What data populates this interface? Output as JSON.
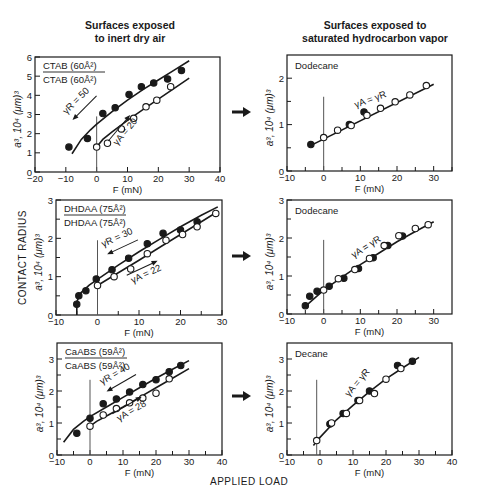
{
  "columns": {
    "left_title": [
      "Surfaces exposed",
      "to inert dry air"
    ],
    "right_title": [
      "Surfaces exposed to",
      "saturated hydrocarbon vapor"
    ]
  },
  "labels": {
    "y_side": "CONTACT RADIUS",
    "x_bottom": "APPLIED LOAD",
    "ylabel": "a³, 10⁴ (μm)³",
    "xlabel": "F (mN)"
  },
  "colors": {
    "ink": "#1a1a1a",
    "background": "#ffffff"
  },
  "chart_data": [
    {
      "id": "p1",
      "type": "scatter",
      "box": {
        "x0": 35,
        "x1": 220,
        "y0": 57,
        "y1": 172
      },
      "xlim": [
        -20,
        40
      ],
      "ylim": [
        0,
        6
      ],
      "xticks": [
        -20,
        -10,
        0,
        10,
        20,
        30,
        40
      ],
      "yticks": [
        0,
        1,
        2,
        3,
        4,
        5,
        6
      ],
      "yminor": [],
      "legend": {
        "top": "CTAB (60Å²)",
        "bottom": "CTAB (60Å²)"
      },
      "annotations": [
        {
          "text": "γR = 50",
          "x": -6,
          "y": 3.6,
          "angle": -45,
          "arrow": "down-left"
        },
        {
          "text": "γA = 20",
          "x": 10,
          "y": 2.0,
          "angle": -50,
          "arrow": "up-right"
        }
      ],
      "series": [
        {
          "name": "retraction",
          "marker": "filled",
          "x": [
            -9,
            -3,
            2,
            6,
            10.5,
            14.5,
            18.5,
            23,
            27.5
          ],
          "y": [
            1.3,
            1.75,
            3.05,
            3.35,
            4.05,
            4.45,
            4.65,
            4.85,
            5.3
          ],
          "curve_x": [
            -8,
            -5,
            -2,
            0,
            5,
            10,
            15,
            20,
            25,
            30
          ],
          "curve_y": [
            0.95,
            1.7,
            2.2,
            2.5,
            3.15,
            3.75,
            4.3,
            4.8,
            5.3,
            5.8
          ]
        },
        {
          "name": "advancing",
          "marker": "open",
          "x": [
            0,
            3.5,
            8,
            12,
            16,
            19.5,
            24
          ],
          "y": [
            1.3,
            1.5,
            2.25,
            2.8,
            3.4,
            3.75,
            4.45
          ],
          "curve_x": [
            0,
            2,
            5,
            10,
            15,
            20,
            25,
            30
          ],
          "curve_y": [
            1.3,
            1.7,
            2.1,
            2.7,
            3.25,
            3.8,
            4.35,
            4.9
          ]
        }
      ],
      "vline_x": 0,
      "vline_top": 2.9
    },
    {
      "id": "p2",
      "type": "scatter",
      "box": {
        "x0": 287,
        "x1": 452,
        "y0": 55,
        "y1": 171
      },
      "xlim": [
        -10,
        35
      ],
      "ylim": [
        0,
        2.5
      ],
      "xticks": [
        -10,
        0,
        10,
        20,
        30
      ],
      "xminor": [
        -5,
        5,
        15,
        25,
        35
      ],
      "yticks": [
        0,
        1,
        2
      ],
      "yminor": [
        0.5,
        1.5
      ],
      "legend_name": "Dodecane",
      "annotations": [
        {
          "text": "γA = γR",
          "x": 13,
          "y": 1.48,
          "angle": -20
        }
      ],
      "series": [
        {
          "name": "retraction",
          "marker": "filled",
          "x": [
            -3.5,
            7,
            11
          ],
          "y": [
            0.57,
            1.0,
            1.27
          ]
        },
        {
          "name": "advancing",
          "marker": "open",
          "x": [
            0,
            3.8,
            7.5,
            11.8,
            15.5,
            19.5,
            23.5,
            28
          ],
          "y": [
            0.72,
            0.88,
            0.98,
            1.2,
            1.35,
            1.49,
            1.64,
            1.84
          ],
          "curve_x": [
            -4,
            30
          ],
          "curve_y": [
            0.53,
            1.87
          ]
        }
      ],
      "vline_x": 0,
      "vline_top": 1.6
    },
    {
      "id": "p3",
      "type": "scatter",
      "box": {
        "x0": 56,
        "x1": 222,
        "y0": 200,
        "y1": 315
      },
      "xlim": [
        -10,
        30
      ],
      "ylim": [
        0,
        3
      ],
      "xticks": [
        -10,
        0,
        10,
        20,
        30
      ],
      "xminor": [
        -5,
        5,
        15,
        25
      ],
      "yticks": [
        0,
        1,
        2,
        3
      ],
      "yminor": [
        0.5,
        1.5,
        2.5
      ],
      "legend": {
        "top": "DHDAA (75Å²)",
        "bottom": "DHDAA (75Å²)"
      },
      "annotations": [
        {
          "text": "γR = 30",
          "x": 5,
          "y": 1.95,
          "angle": -25,
          "arrow": "down-left"
        },
        {
          "text": "γA = 22",
          "x": 12,
          "y": 1.0,
          "angle": -25,
          "arrow": "up-right"
        }
      ],
      "series": [
        {
          "name": "retraction",
          "marker": "filled",
          "x": [
            -5,
            -4.5,
            -2.8,
            -0.3,
            3.5,
            7.5,
            12,
            15.8,
            20,
            24
          ],
          "y": [
            0.28,
            0.5,
            0.63,
            0.94,
            1.18,
            1.48,
            1.86,
            2.13,
            2.22,
            2.43
          ],
          "curve_x": [
            -5,
            -5,
            -4,
            -2,
            0,
            5,
            10,
            15,
            20,
            25,
            29
          ],
          "curve_y": [
            0,
            0.35,
            0.58,
            0.78,
            0.93,
            1.3,
            1.65,
            1.98,
            2.3,
            2.6,
            2.82
          ]
        },
        {
          "name": "advancing",
          "marker": "open",
          "x": [
            0,
            4,
            8,
            12,
            16.5,
            20.5,
            24,
            28.5
          ],
          "y": [
            0.77,
            1.0,
            1.2,
            1.6,
            1.95,
            2.1,
            2.3,
            2.65
          ],
          "curve_x": [
            0,
            5,
            10,
            15,
            20,
            25,
            29
          ],
          "curve_y": [
            0.77,
            1.1,
            1.43,
            1.77,
            2.1,
            2.43,
            2.7
          ]
        }
      ],
      "vline_x": 0,
      "vline_top": 1.95
    },
    {
      "id": "p4",
      "type": "scatter",
      "box": {
        "x0": 287,
        "x1": 452,
        "y0": 200,
        "y1": 314
      },
      "xlim": [
        -10,
        35
      ],
      "ylim": [
        0,
        3
      ],
      "xticks": [
        -10,
        0,
        10,
        20,
        30
      ],
      "xminor": [
        -5,
        5,
        15,
        25
      ],
      "yticks": [
        0,
        1,
        2,
        3
      ],
      "yminor": [
        0.5,
        1.5,
        2.5
      ],
      "legend_name": "Dodecane",
      "annotations": [
        {
          "text": "γA = γR",
          "x": 12,
          "y": 1.7,
          "angle": -32
        }
      ],
      "series": [
        {
          "name": "retraction",
          "marker": "filled",
          "x": [
            -5,
            -3.8,
            -1.8,
            1.5,
            5.5,
            9.5,
            13.5,
            17.5,
            21.5
          ],
          "y": [
            0.22,
            0.47,
            0.6,
            0.73,
            0.94,
            1.2,
            1.48,
            1.8,
            2.05
          ],
          "curve_x": [
            -5,
            0,
            5,
            10,
            15,
            20,
            25,
            30
          ],
          "curve_y": [
            0.2,
            0.63,
            0.97,
            1.3,
            1.6,
            1.9,
            2.17,
            2.43
          ]
        },
        {
          "name": "advancing",
          "marker": "open",
          "x": [
            0,
            4,
            8.5,
            12.5,
            16.5,
            20.5,
            25,
            28.5
          ],
          "y": [
            0.63,
            0.93,
            1.17,
            1.46,
            1.8,
            2.06,
            2.25,
            2.35
          ]
        }
      ],
      "vline_x": 0,
      "vline_top": 1.95
    },
    {
      "id": "p5",
      "type": "scatter",
      "box": {
        "x0": 57,
        "x1": 222,
        "y0": 343,
        "y1": 455
      },
      "xlim": [
        -10,
        40
      ],
      "ylim": [
        0,
        3.5
      ],
      "xticks": [
        -10,
        0,
        10,
        20,
        30,
        40
      ],
      "xminor": [
        -5,
        5,
        15,
        25,
        35
      ],
      "yticks": [
        0,
        1,
        2,
        3
      ],
      "yminor": [
        0.5,
        1.5,
        2.5
      ],
      "legend": {
        "top": "CaABS (59Å²)",
        "bottom": "CaABS (59Å²)"
      },
      "annotations": [
        {
          "text": "γR = 40",
          "x": 8,
          "y": 2.45,
          "angle": -30,
          "arrow": "down-left"
        },
        {
          "text": "γA = 28",
          "x": 13,
          "y": 1.3,
          "angle": -30,
          "arrow": "up-right"
        }
      ],
      "series": [
        {
          "name": "retraction",
          "marker": "filled",
          "x": [
            -4,
            0,
            4,
            8,
            12,
            16,
            20,
            24,
            27.5
          ],
          "y": [
            0.68,
            1.15,
            1.6,
            1.75,
            1.97,
            2.2,
            2.35,
            2.6,
            2.8
          ],
          "curve_x": [
            -8,
            -5,
            -2,
            0,
            5,
            10,
            15,
            20,
            25,
            30
          ],
          "curve_y": [
            0.4,
            0.8,
            1.05,
            1.2,
            1.5,
            1.8,
            2.1,
            2.4,
            2.68,
            2.95
          ]
        },
        {
          "name": "advancing",
          "marker": "open",
          "x": [
            0,
            4,
            8,
            12,
            16,
            20,
            24
          ],
          "y": [
            0.9,
            1.25,
            1.45,
            1.63,
            1.78,
            1.93,
            2.38
          ],
          "curve_x": [
            0,
            2,
            5,
            10,
            15,
            20,
            25,
            30
          ],
          "curve_y": [
            0.9,
            1.05,
            1.22,
            1.5,
            1.8,
            2.1,
            2.4,
            2.7
          ]
        }
      ],
      "vline_x": 0,
      "vline_top": 2.35
    },
    {
      "id": "p6",
      "type": "scatter",
      "box": {
        "x0": 287,
        "x1": 452,
        "y0": 343,
        "y1": 455
      },
      "xlim": [
        -10,
        40
      ],
      "ylim": [
        0,
        3.5
      ],
      "xticks": [
        -10,
        0,
        10,
        20,
        30,
        40
      ],
      "xminor": [
        -5,
        5,
        15,
        25,
        35
      ],
      "yticks": [
        0,
        1,
        2,
        3
      ],
      "yminor": [
        0.5,
        1.5,
        2.5
      ],
      "legend_name": "Decane",
      "annotations": [
        {
          "text": "γA = γR",
          "x": 12,
          "y": 2.2,
          "angle": -50
        }
      ],
      "series": [
        {
          "name": "retraction",
          "marker": "filled",
          "x": [
            3,
            7,
            11.5,
            15,
            23.5,
            28
          ],
          "y": [
            0.97,
            1.3,
            1.7,
            2.0,
            2.8,
            2.93
          ]
        },
        {
          "name": "advancing",
          "marker": "open",
          "x": [
            -1,
            3.5,
            8,
            12,
            16.5,
            20,
            24.5
          ],
          "y": [
            0.45,
            1.0,
            1.3,
            1.7,
            1.92,
            2.37,
            2.7
          ],
          "curve_x": [
            -2,
            0,
            5,
            10,
            15,
            20,
            25,
            30
          ],
          "curve_y": [
            0.3,
            0.55,
            1.1,
            1.55,
            1.98,
            2.38,
            2.72,
            3.05
          ]
        }
      ],
      "vline_x": -1,
      "vline_top": 2.35
    }
  ],
  "arrows": [
    {
      "x": 232,
      "y": 112
    },
    {
      "x": 232,
      "y": 256
    },
    {
      "x": 232,
      "y": 396
    }
  ]
}
